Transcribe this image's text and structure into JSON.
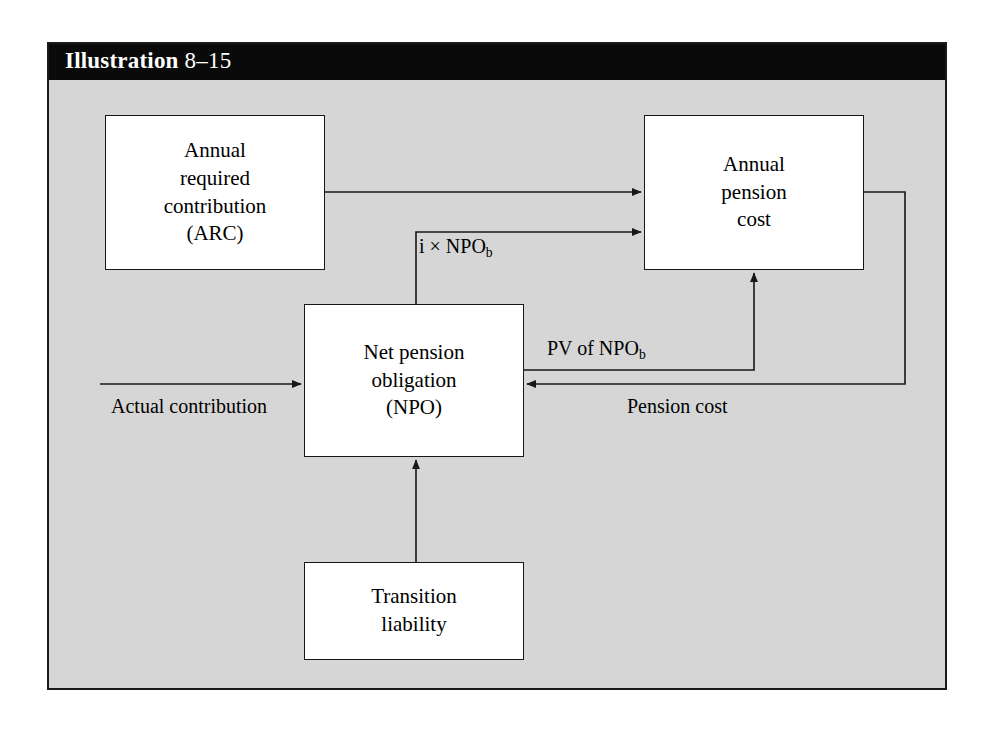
{
  "figure": {
    "header": {
      "label_strong": "Illustration",
      "label_number": "8–15"
    },
    "background_color": "#d6d6d6",
    "header_color": "#0a0a0a",
    "border_color": "#1a1a1a"
  },
  "diagram": {
    "type": "flowchart",
    "nodes": [
      {
        "id": "arc",
        "lines": [
          "Annual",
          "required",
          "contribution",
          "(ARC)"
        ]
      },
      {
        "id": "annual-pension-cost",
        "lines": [
          "Annual",
          "pension",
          "cost"
        ]
      },
      {
        "id": "net-pension-obligation",
        "lines": [
          "Net pension",
          "obligation",
          "(NPO)"
        ]
      },
      {
        "id": "transition-liability",
        "lines": [
          "Transition",
          "liability"
        ]
      }
    ],
    "edge_labels": {
      "i_times_npo_b": {
        "prefix": "i × NPO",
        "sub": "b"
      },
      "pv_of_npo_b": {
        "prefix": "PV of NPO",
        "sub": "b"
      },
      "pension_cost": "Pension cost",
      "actual_contribution": "Actual contribution"
    },
    "edges": [
      {
        "from": "arc",
        "to": "annual-pension-cost",
        "label": ""
      },
      {
        "from": "net-pension-obligation",
        "to": "annual-pension-cost",
        "label": "i × NPO b"
      },
      {
        "from": "net-pension-obligation",
        "to": "annual-pension-cost",
        "label": "PV of NPO b"
      },
      {
        "from": "annual-pension-cost",
        "to": "net-pension-obligation",
        "label": "Pension cost"
      },
      {
        "from": "external",
        "to": "net-pension-obligation",
        "label": "Actual contribution"
      },
      {
        "from": "transition-liability",
        "to": "net-pension-obligation",
        "label": ""
      }
    ]
  }
}
